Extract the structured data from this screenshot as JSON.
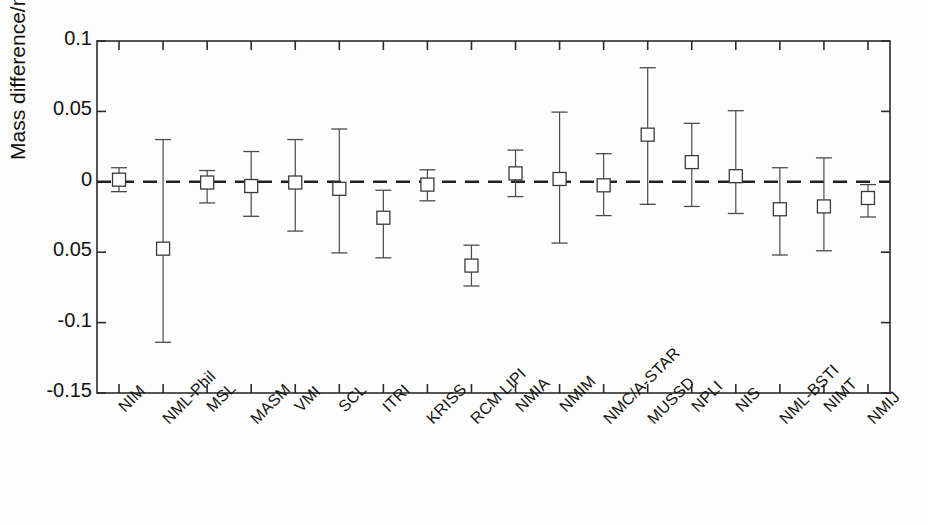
{
  "chart_data": {
    "type": "scatter",
    "title": "",
    "xlabel": "",
    "ylabel": "Mass difference/mg",
    "ylim": [
      -0.15,
      0.1
    ],
    "yticks": [
      0.1,
      0.05,
      0,
      -0.05,
      -0.1,
      -0.15
    ],
    "ytick_labels": [
      "0.1",
      "0.05",
      "0",
      "0.05",
      "-0.1",
      "-0.15"
    ],
    "grid": false,
    "legend": "none",
    "reference_line": {
      "y": 0,
      "style": "dashed",
      "color": "#222222"
    },
    "marker": "open-square",
    "error_bars": "vertical",
    "categories": [
      "NIM",
      "NML-Phil",
      "MSL",
      "MASM",
      "VMI",
      "SCL",
      "ITRI",
      "KRISS",
      "RCM LIPI",
      "NMIA",
      "NMIM",
      "NMC/A-STAR",
      "MUSSD",
      "NPLI",
      "NIS",
      "NML-BSTI",
      "NIMT",
      "NMIJ"
    ],
    "values": [
      0.0015,
      -0.0475,
      -0.0005,
      -0.003,
      -0.0005,
      -0.005,
      -0.0255,
      -0.002,
      -0.0595,
      0.006,
      0.002,
      -0.0025,
      0.0335,
      0.014,
      0.004,
      -0.0195,
      -0.0175,
      -0.0115
    ],
    "err_upper": [
      0.0085,
      0.0775,
      0.0085,
      0.0245,
      0.0305,
      0.0425,
      0.0195,
      0.0105,
      0.0145,
      0.0165,
      0.0475,
      0.0225,
      0.0475,
      0.0275,
      0.0465,
      0.0295,
      0.0345,
      0.0095
    ],
    "err_lower": [
      0.0085,
      0.0665,
      0.0145,
      0.0215,
      0.0345,
      0.0455,
      0.0285,
      0.0115,
      0.0145,
      0.0165,
      0.0455,
      0.0215,
      0.0495,
      0.0315,
      0.0265,
      0.0325,
      0.0315,
      0.0135
    ]
  },
  "axis": {
    "ylabel": "Mass difference/mg",
    "ytick_labels": [
      "0.1",
      "0.05",
      "0",
      "0.05",
      "-0.1",
      "-0.15"
    ]
  },
  "footer": {
    "caption": ""
  }
}
